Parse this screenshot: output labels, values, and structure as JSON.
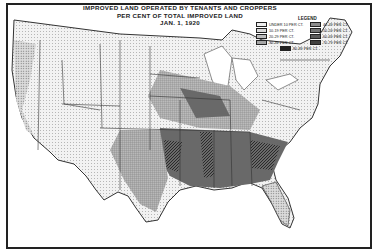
{
  "title": {
    "line1": "IMPROVED LAND OPERATED BY TENANTS AND CROPPERS",
    "line2": "PER CENT OF TOTAL IMPROVED LAND",
    "line3": "JAN. 1, 1920"
  },
  "legend": {
    "title": "LEGEND",
    "items": [
      {
        "label": "UNDER 10 PER CT.",
        "pattern": "dots-light",
        "color": "#eeeeee"
      },
      {
        "label": "10-19 PER CT.",
        "pattern": "dots",
        "color": "#d8d8d8"
      },
      {
        "label": "20-29 PER CT.",
        "pattern": "lines-light",
        "color": "#bdbdbd"
      },
      {
        "label": "30-39 PER CT.",
        "pattern": "grid",
        "color": "#a5a5a5"
      },
      {
        "label": "80-89 PER CT.",
        "pattern": "solid-dark",
        "color": "#222222"
      },
      {
        "label": "40-49 PER CT.",
        "pattern": "crosshatch",
        "color": "#8c8c8c"
      },
      {
        "label": "50-59 PER CT.",
        "pattern": "dense-dots",
        "color": "#737373"
      },
      {
        "label": "60-69 PER CT.",
        "pattern": "diagonal",
        "color": "#5a5a5a"
      },
      {
        "label": "70-79 PER CT.",
        "pattern": "dense-diagonal",
        "color": "#404040"
      }
    ]
  }
}
